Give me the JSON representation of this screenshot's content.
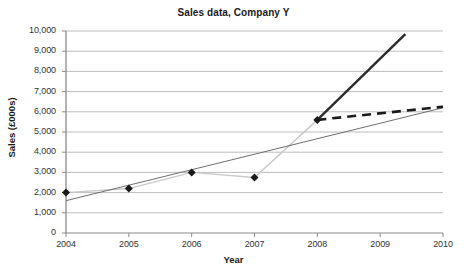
{
  "chart_data": {
    "type": "line",
    "title": "Sales data, Company Y",
    "xlabel": "Year",
    "ylabel": "Sales (£000s)",
    "xlim": [
      2004,
      2010
    ],
    "ylim": [
      0,
      10000
    ],
    "grid": true,
    "legend": "none",
    "xticks": [
      "2004",
      "2005",
      "2006",
      "2007",
      "2008",
      "2009",
      "2010"
    ],
    "yticks": [
      "0",
      "1,000",
      "2,000",
      "3,000",
      "4,000",
      "5,000",
      "6,000",
      "7,000",
      "8,000",
      "9,000",
      "10,000"
    ],
    "x": [
      2004,
      2005,
      2006,
      2007,
      2008
    ],
    "series": [
      {
        "name": "Actual sales",
        "style": "solid-light-with-diamond-markers",
        "color": "#c9c9c9",
        "marker_color": "#1a1a1a",
        "values": [
          2000,
          2200,
          3000,
          2750,
          5600
        ]
      },
      {
        "name": "Linear trend line",
        "style": "thin-solid",
        "color": "#6e6e6e",
        "x": [
          2004,
          2010
        ],
        "values": [
          1600,
          6200
        ]
      },
      {
        "name": "Optimistic forecast",
        "style": "thick-solid",
        "color": "#2b2b2b",
        "x": [
          2008,
          2009.4
        ],
        "values": [
          5600,
          9850
        ]
      },
      {
        "name": "Conservative forecast",
        "style": "thick-dashed",
        "color": "#1a1a1a",
        "x": [
          2008,
          2010
        ],
        "values": [
          5600,
          6250
        ]
      }
    ]
  },
  "axes": {
    "x_tick_values": [
      2004,
      2005,
      2006,
      2007,
      2008,
      2009,
      2010
    ],
    "y_tick_values": [
      0,
      1000,
      2000,
      3000,
      4000,
      5000,
      6000,
      7000,
      8000,
      9000,
      10000
    ]
  },
  "colors": {
    "grid": "#b5b5b5",
    "axis": "#8a8a8a",
    "text": "#1a1a1a",
    "data_line": "#c9c9c9",
    "trend_line": "#6e6e6e",
    "forecast_solid": "#2b2b2b",
    "forecast_dashed": "#1a1a1a",
    "marker": "#1a1a1a"
  }
}
